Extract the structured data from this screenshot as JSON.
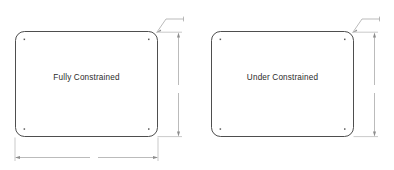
{
  "drawing": {
    "title": "Sketch Constraint Comparison",
    "background_color": "#ffffff",
    "line_color": "#3a3a3a",
    "dimension_color": "#8d8d8d",
    "text_color": "#2b2b2b",
    "panels": [
      {
        "id": "fully-constrained",
        "label": "Fully Constrained",
        "shape": "rounded-rectangle",
        "corner_points": 4,
        "dimensions": {
          "vertical_label": "",
          "horizontal_label": "",
          "leader_label": "",
          "has_vertical": true,
          "has_horizontal": true,
          "has_leader": true
        }
      },
      {
        "id": "under-constrained",
        "label": "Under Constrained",
        "shape": "rounded-rectangle",
        "corner_points": 4,
        "dimensions": {
          "vertical_label": "",
          "horizontal_label": "",
          "leader_label": "",
          "has_vertical": true,
          "has_horizontal": false,
          "has_leader": true
        }
      }
    ]
  }
}
